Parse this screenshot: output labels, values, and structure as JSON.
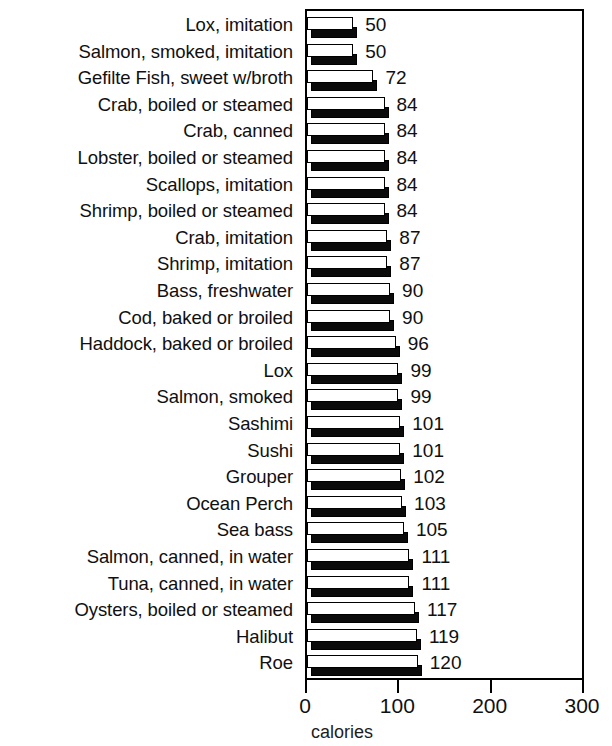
{
  "chart_data": {
    "type": "bar",
    "orientation": "horizontal",
    "title": "",
    "xlabel": "calories",
    "ylabel": "",
    "xlim": [
      0,
      300
    ],
    "xticks": [
      0,
      100,
      200,
      300
    ],
    "xtick_labels": [
      "0",
      "100",
      "200",
      "300"
    ],
    "grid": false,
    "legend": "none",
    "style": "3d-bar-black-shadow",
    "categories": [
      "Lox,  imitation",
      "Salmon, smoked,  imitation",
      "Gefilte Fish, sweet w/broth",
      "Crab, boiled or steamed",
      "Crab, canned",
      "Lobster,  boiled or steamed",
      "Scallops, imitation",
      "Shrimp, boiled or steamed",
      "Crab, imitation",
      "Shrimp, imitation",
      "Bass, freshwater",
      "Cod, baked or broiled",
      "Haddock, baked or broiled",
      "Lox",
      "Salmon, smoked",
      "Sashimi",
      "Sushi",
      "Grouper",
      "Ocean Perch",
      "Sea bass",
      "Salmon, canned, in water",
      "Tuna, canned, in water",
      "Oysters, boiled or steamed",
      "Halibut",
      "Roe"
    ],
    "values": [
      50,
      50,
      72,
      84,
      84,
      84,
      84,
      84,
      87,
      87,
      90,
      90,
      96,
      99,
      99,
      101,
      101,
      102,
      103,
      105,
      111,
      111,
      117,
      119,
      120
    ],
    "value_labels": [
      "50",
      "50",
      "72",
      "84",
      "84",
      "84",
      "84",
      "84",
      "87",
      "87",
      "90",
      "90",
      "96",
      "99",
      "99",
      "101",
      "101",
      "102",
      "103",
      "105",
      "111",
      "111",
      "117",
      "119",
      "120"
    ],
    "colors": {
      "bar_face": "#ffffff",
      "bar_outline": "#000000",
      "bar_shadow": "#0b0b0b",
      "axis": "#000000",
      "text": "#101010",
      "background": "#ffffff"
    }
  }
}
